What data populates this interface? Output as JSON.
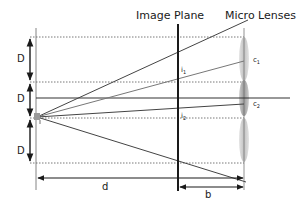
{
  "title_labels": {
    "image_plane": "Image Plane",
    "micro_lenses": "Micro Lenses"
  },
  "dimension_labels": {
    "D_top": "D",
    "D_middle": "D",
    "D_bottom": "D",
    "d": "d",
    "b": "b"
  },
  "point_labels": {
    "i1": "i",
    "i1_sub": "1",
    "i2": "i",
    "i2_sub": "2",
    "c1": "c",
    "c1_sub": "1",
    "c2": "c",
    "c2_sub": "2"
  },
  "colors": {
    "line": "#333333",
    "dashed": "#555555",
    "ray_dark": "#444444",
    "ray_light": "#777777",
    "lens_fill": "#b0b0b0",
    "lens_dark": "#888888",
    "source": "#999999"
  }
}
